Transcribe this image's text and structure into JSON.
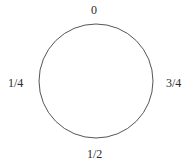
{
  "diagram": {
    "type": "circle-with-fraction-labels",
    "circle": {
      "cx": 96,
      "cy": 81,
      "r": 57,
      "stroke": "#555555",
      "fill": "#ffffff"
    },
    "labels": {
      "top": "0",
      "left": "1/4",
      "bottom": "1/2",
      "right": "3/4"
    }
  }
}
